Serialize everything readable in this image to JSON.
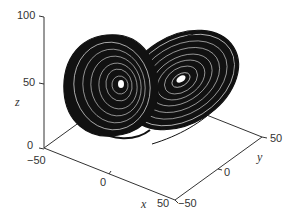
{
  "figure": {
    "axes": {
      "x": {
        "label": "x",
        "ticks": [
          "−50",
          "0",
          "50"
        ],
        "range": [
          -50,
          50
        ]
      },
      "y": {
        "label": "y",
        "ticks": [
          "−50",
          "0",
          "50"
        ],
        "range": [
          -50,
          50
        ]
      },
      "z": {
        "label": "z",
        "ticks": [
          "0",
          "50",
          "100"
        ],
        "range": [
          0,
          100
        ]
      }
    },
    "colors": {
      "ink": "#111111",
      "axis": "#333333",
      "background": "#ffffff"
    }
  }
}
